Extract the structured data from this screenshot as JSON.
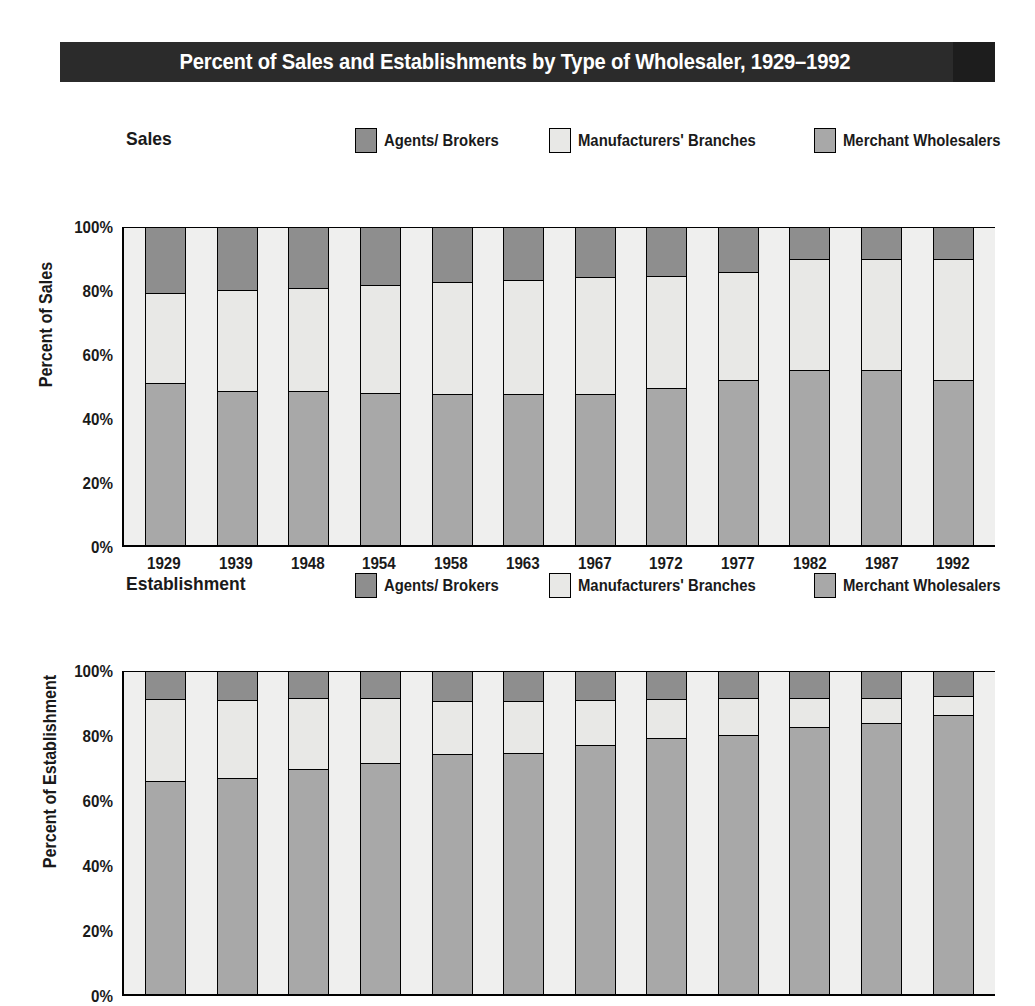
{
  "title": "Percent of Sales and Establishments by Type of Wholesaler, 1929–1992",
  "colors": {
    "agents": "#8e8e8e",
    "manufacturers": "#e8e8e6",
    "merchant": "#a8a8a8",
    "title_band": "#2b2b2b",
    "plot_background": "#efefee"
  },
  "legend": {
    "items": [
      {
        "label": "Agents/ Brokers",
        "key": "agents"
      },
      {
        "label": "Manufacturers' Branches",
        "key": "manufacturers"
      },
      {
        "label": "Merchant Wholesalers",
        "key": "merchant"
      }
    ]
  },
  "charts": [
    {
      "subtitle": "Sales",
      "y_title": "Percent of Sales",
      "y_ticks": [
        "100%",
        "80%",
        "60%",
        "40%",
        "20%",
        "0%"
      ]
    },
    {
      "subtitle": "Establishment",
      "y_title": "Percent of Establishment",
      "y_ticks": [
        "100%",
        "80%",
        "60%",
        "40%",
        "20%",
        "0%"
      ]
    }
  ],
  "chart_data": [
    {
      "type": "bar",
      "stacked": true,
      "title": "Sales",
      "xlabel": "",
      "ylabel": "Percent of Sales",
      "ylim": [
        0,
        100
      ],
      "grid": false,
      "legend_position": "top-right",
      "categories": [
        "1929",
        "1939",
        "1948",
        "1954",
        "1958",
        "1963",
        "1967",
        "1972",
        "1977",
        "1982",
        "1987",
        "1992"
      ],
      "series": [
        {
          "name": "Merchant Wholesalers",
          "values": [
            50.7,
            48.3,
            48.3,
            47.6,
            47.3,
            47.3,
            47.4,
            49.1,
            51.7,
            54.8,
            54.8,
            51.8
          ]
        },
        {
          "name": "Manufacturers' Branches",
          "values": [
            28.5,
            31.9,
            32.4,
            34.2,
            35.5,
            36.0,
            36.7,
            35.6,
            34.1,
            35.2,
            35.2,
            38.2
          ]
        },
        {
          "name": "Agents/ Brokers",
          "values": [
            20.8,
            19.8,
            19.3,
            18.2,
            17.2,
            16.7,
            15.9,
            15.3,
            14.2,
            10.0,
            10.0,
            10.0
          ]
        }
      ]
    },
    {
      "type": "bar",
      "stacked": true,
      "title": "Establishment",
      "xlabel": "",
      "ylabel": "Percent of Establishment",
      "ylim": [
        0,
        100
      ],
      "grid": false,
      "legend_position": "top-right",
      "categories": [
        "1929",
        "1939",
        "1948",
        "1954",
        "1958",
        "1963",
        "1967",
        "1972",
        "1977",
        "1982",
        "1987",
        "1992"
      ],
      "series": [
        {
          "name": "Merchant Wholesalers",
          "values": [
            65.8,
            66.8,
            69.5,
            71.4,
            74.1,
            74.5,
            77.1,
            79.1,
            80.2,
            82.7,
            84.0,
            86.2
          ]
        },
        {
          "name": "Manufacturers' Branches",
          "values": [
            25.5,
            24.3,
            22.2,
            20.2,
            16.7,
            16.3,
            13.8,
            12.2,
            11.5,
            9.0,
            7.7,
            6.0
          ]
        },
        {
          "name": "Agents/ Brokers",
          "values": [
            8.7,
            8.9,
            8.3,
            8.4,
            9.2,
            9.2,
            9.1,
            8.7,
            8.3,
            8.3,
            8.3,
            7.8
          ]
        }
      ]
    }
  ]
}
